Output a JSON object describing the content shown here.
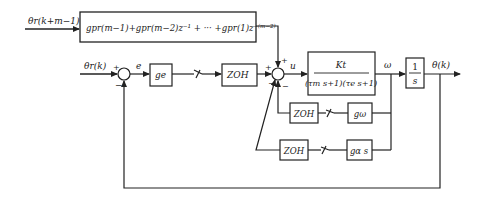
{
  "diagram": {
    "type": "control-block-diagram",
    "signals": {
      "theta_r_future": "θr(k+m−1)",
      "theta_r": "θr(k)",
      "error": "e",
      "control": "u",
      "omega": "ω",
      "theta": "θ(k)"
    },
    "blocks": {
      "feedforward": "gpr(m−1)+gpr(m−2)z⁻¹ + ··· +gpr(1)z⁻⁽ᵐ⁻²⁾",
      "gain_e": "ge",
      "zoh_main": "ZOH",
      "plant_num": "Kt",
      "plant_den": "(τm s+1)(τe s+1)",
      "integrator_num": "1",
      "integrator_den": "s",
      "zoh_omega": "ZOH",
      "gain_omega": "gω",
      "zoh_alpha": "ZOH",
      "gain_alpha": "gα s"
    },
    "signs": {
      "sum1_plus": "+",
      "sum1_minus": "−",
      "sum2_plus_left": "+",
      "sum2_plus_top": "+",
      "sum2_minus_a": "−",
      "sum2_minus_b": "−"
    },
    "colors": {
      "line": "#222222",
      "background": "#ffffff"
    }
  }
}
